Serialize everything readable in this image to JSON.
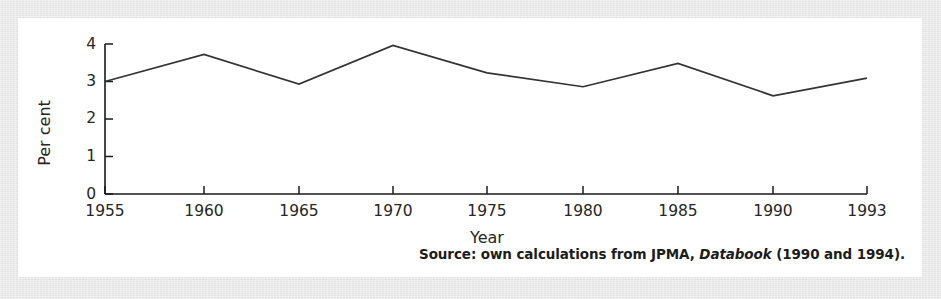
{
  "figure": {
    "source_note_prefix": "Source: own calculations from JPMA,",
    "source_note_book": "Databook",
    "source_note_suffix": "(1990 and 1994)."
  },
  "chart_data": {
    "type": "line",
    "title": "",
    "xlabel": "Year",
    "ylabel": "Per cent",
    "categories": [
      "1955",
      "1960",
      "1965",
      "1970",
      "1975",
      "1980",
      "1985",
      "1990",
      "1993"
    ],
    "x": [
      1955,
      1960,
      1965,
      1970,
      1975,
      1980,
      1985,
      1990,
      1993
    ],
    "values": [
      3.0,
      3.72,
      2.93,
      3.96,
      3.23,
      2.86,
      3.48,
      2.62,
      3.09
    ],
    "series": [
      {
        "name": "Per cent",
        "values": [
          3.0,
          3.72,
          2.93,
          3.96,
          3.23,
          2.86,
          3.48,
          2.62,
          3.09
        ]
      }
    ],
    "yticks": [
      0,
      1,
      2,
      3,
      4
    ],
    "ytick_labels": [
      "0",
      "1",
      "2",
      "3",
      "4"
    ],
    "xtick_labels": [
      "1955",
      "1960",
      "1965",
      "1970",
      "1975",
      "1980",
      "1985",
      "1990",
      "1993"
    ],
    "ylim": [
      0,
      4
    ],
    "xlim": [
      1955,
      1993
    ],
    "grid": false,
    "legend": false,
    "legend_position": "none",
    "line_color": "#333333"
  }
}
